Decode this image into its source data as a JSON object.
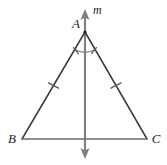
{
  "figure": {
    "kind": "geometry-diagram",
    "width": 167,
    "height": 165,
    "background_color": "#ffffff"
  },
  "colors": {
    "triangle_stroke": "#3a3a3c",
    "base_stroke": "#6e6e70",
    "line_m_stroke": "#7f7f81",
    "arc_stroke": "#7f7f81",
    "tick_stroke": "#5a5a5c",
    "label_fill": "#231f20"
  },
  "labels": {
    "vertex_a": "A",
    "vertex_b": "B",
    "vertex_c": "C",
    "line_m": "m"
  },
  "points": {
    "a": {
      "x": 85,
      "y": 32
    },
    "b": {
      "x": 22,
      "y": 139
    },
    "c": {
      "x": 147,
      "y": 139
    },
    "midpoint_bc": {
      "x": 85,
      "y": 139
    },
    "line_m_top": {
      "x": 85,
      "y": 10
    },
    "line_m_bottom": {
      "x": 85,
      "y": 158
    }
  },
  "label_positions": {
    "vertex_a": {
      "x": 76,
      "y": 28
    },
    "vertex_b": {
      "x": 10,
      "y": 142
    },
    "vertex_c": {
      "x": 152,
      "y": 142
    },
    "line_m": {
      "x": 92,
      "y": 13
    }
  },
  "congruence_marks": {
    "side_ticks": [
      {
        "name": "tick-side-ab",
        "x": 53.5,
        "y": 85.5,
        "angle_deg": 59.5
      },
      {
        "name": "tick-side-ac",
        "x": 116.0,
        "y": 85.5,
        "angle_deg": -59.5
      }
    ],
    "angle_arc": {
      "center_x": 85,
      "center_y": 32,
      "radius": 20,
      "start_angle_deg": 239.5,
      "end_angle_deg": 300.5
    },
    "angle_ticks": [
      {
        "name": "tick-angle-left",
        "x": 75.8,
        "y": 50.6
      },
      {
        "name": "tick-angle-right",
        "x": 94.2,
        "y": 50.6
      }
    ]
  },
  "arrows": {
    "top": {
      "name": "arrowhead-up",
      "tip_x": 85,
      "tip_y": 10,
      "width": 9,
      "height": 11
    },
    "bottom": {
      "name": "arrowhead-down",
      "tip_x": 85,
      "tip_y": 158,
      "width": 9,
      "height": 11
    }
  }
}
